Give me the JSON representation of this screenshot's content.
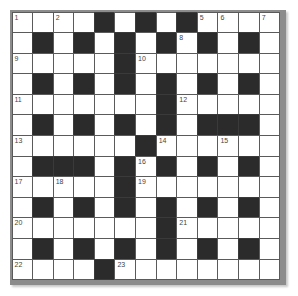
{
  "puzzle": {
    "type": "crossword",
    "rows": 13,
    "cols": 13,
    "grid": [
      "....#.#.#....",
      ".#.#.#.#.#.#.",
      ".....#.......",
      ".#.#.#.#.#.#.",
      ".......#.....",
      ".#.#.#.#.###.",
      "......#......",
      ".###.#.#.#.#.",
      ".....#.......",
      ".#.#.#.#.#.#.",
      ".......#.....",
      ".#.#.#.#.#.#.",
      "....#........"
    ],
    "numbers": [
      {
        "r": 0,
        "c": 0,
        "n": "1"
      },
      {
        "r": 0,
        "c": 2,
        "n": "2"
      },
      {
        "r": 0,
        "c": 4,
        "n": "3"
      },
      {
        "r": 0,
        "c": 6,
        "n": "4"
      },
      {
        "r": 0,
        "c": 9,
        "n": "5"
      },
      {
        "r": 0,
        "c": 10,
        "n": "6"
      },
      {
        "r": 0,
        "c": 12,
        "n": "7"
      },
      {
        "r": 1,
        "c": 8,
        "n": "8"
      },
      {
        "r": 2,
        "c": 0,
        "n": "9"
      },
      {
        "r": 2,
        "c": 6,
        "n": "10"
      },
      {
        "r": 4,
        "c": 0,
        "n": "11"
      },
      {
        "r": 4,
        "c": 8,
        "n": "12"
      },
      {
        "r": 6,
        "c": 0,
        "n": "13"
      },
      {
        "r": 6,
        "c": 7,
        "n": "14"
      },
      {
        "r": 6,
        "c": 10,
        "n": "15"
      },
      {
        "r": 7,
        "c": 6,
        "n": "16"
      },
      {
        "r": 8,
        "c": 0,
        "n": "17"
      },
      {
        "r": 8,
        "c": 2,
        "n": "18"
      },
      {
        "r": 8,
        "c": 6,
        "n": "19"
      },
      {
        "r": 10,
        "c": 0,
        "n": "20"
      },
      {
        "r": 10,
        "c": 8,
        "n": "21"
      },
      {
        "r": 12,
        "c": 0,
        "n": "22"
      },
      {
        "r": 12,
        "c": 5,
        "n": "23"
      }
    ],
    "colors": {
      "block": "#2b2b2b",
      "cell": "#ffffff",
      "border": "#5a5a5a",
      "frame": "#8c8c8c",
      "number": "#444444"
    }
  }
}
